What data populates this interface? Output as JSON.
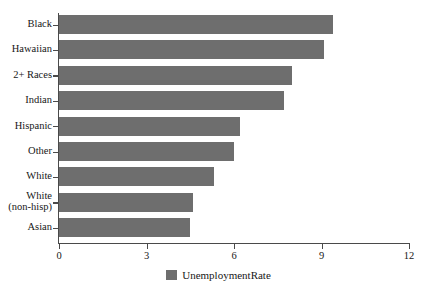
{
  "chart_data": {
    "type": "bar",
    "orientation": "horizontal",
    "title": "",
    "xlabel": "",
    "ylabel": "",
    "categories": [
      "Black",
      "Hawaiian",
      "2+ Races",
      "Indian",
      "Hispanic",
      "Other",
      "White",
      "White\n(non-hisp)",
      "Asian"
    ],
    "series": [
      {
        "name": "UnemploymentRate",
        "color": "#6e6e6e",
        "values": [
          9.4,
          9.1,
          8.0,
          7.7,
          6.2,
          6.0,
          5.3,
          4.6,
          4.5
        ]
      }
    ],
    "xlim": [
      0,
      12
    ],
    "xticks": [
      "0",
      "3",
      "6",
      "9",
      "12"
    ],
    "xtick_values": [
      0,
      3,
      6,
      9,
      12
    ],
    "grid": false,
    "legend": {
      "position": "bottom",
      "entries": [
        {
          "label": "UnemploymentRate",
          "color": "#6e6e6e"
        }
      ]
    }
  },
  "legend": {
    "label": "UnemploymentRate"
  },
  "colors": {
    "bar": "#6e6e6e",
    "axis": "#4a4a4a",
    "text": "#171717",
    "background": "#ffffff"
  }
}
